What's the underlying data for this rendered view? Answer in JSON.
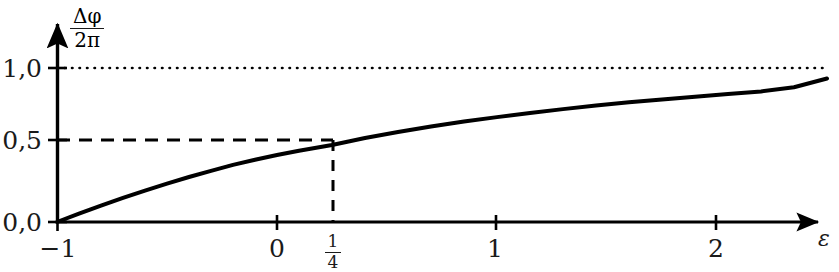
{
  "chart_data": {
    "type": "line",
    "title": "",
    "subtitle": "",
    "xlabel": "ε",
    "ylabel_numerator": "Δφ",
    "ylabel_denominator": "2π",
    "ylabel": "Δφ / 2π",
    "xlim": [
      -1.0,
      2.5
    ],
    "ylim": [
      0.0,
      1.12
    ],
    "grid": false,
    "legend": null,
    "x_ticks": [
      -1,
      0,
      0.25,
      1,
      2
    ],
    "x_tick_labels": [
      "−1",
      "0",
      "1/4",
      "1",
      "2"
    ],
    "x_tick_label_kinds": [
      "plain",
      "plain",
      "fraction",
      "plain",
      "plain"
    ],
    "x_tick_fraction_numerator": "1",
    "x_tick_fraction_denominator": "4",
    "y_ticks": [
      0.0,
      0.5,
      1.0
    ],
    "y_tick_labels": [
      "0,0",
      "0,5",
      "1,0"
    ],
    "series": [
      {
        "name": "Δφ/2π",
        "style": "solid",
        "color": "#000000",
        "width": 4,
        "x": [
          -1.0,
          -0.9,
          -0.8,
          -0.7,
          -0.6,
          -0.5,
          -0.4,
          -0.3,
          -0.2,
          -0.1,
          0.0,
          0.1,
          0.25,
          0.4,
          0.55,
          0.7,
          0.85,
          1.0,
          1.15,
          1.3,
          1.45,
          1.6,
          1.75,
          1.9,
          2.05,
          2.2,
          2.35,
          2.5
        ],
        "y": [
          0.0,
          0.055,
          0.107,
          0.157,
          0.204,
          0.249,
          0.292,
          0.332,
          0.371,
          0.404,
          0.435,
          0.463,
          0.5,
          0.545,
          0.584,
          0.62,
          0.652,
          0.681,
          0.708,
          0.733,
          0.756,
          0.777,
          0.796,
          0.814,
          0.831,
          0.848,
          0.875,
          0.932
        ]
      }
    ],
    "reference_lines": [
      {
        "name": "asymptote",
        "orientation": "horizontal",
        "value": 1.0,
        "style": "dotted",
        "color": "#000000",
        "extent": "full"
      },
      {
        "name": "half-level-guide",
        "orientation": "horizontal",
        "value": 0.5,
        "style": "dashed",
        "color": "#000000",
        "extent": "to-marked-point"
      },
      {
        "name": "quarter-epsilon-guide",
        "orientation": "vertical",
        "value": 0.25,
        "style": "dashed",
        "color": "#000000",
        "extent": "to-marked-point"
      }
    ],
    "marked_point": {
      "x": 0.25,
      "y": 0.5,
      "x_label": "1/4",
      "y_label": "0,5"
    },
    "annotations": [],
    "axis_arrows": {
      "x": true,
      "y": true
    }
  }
}
